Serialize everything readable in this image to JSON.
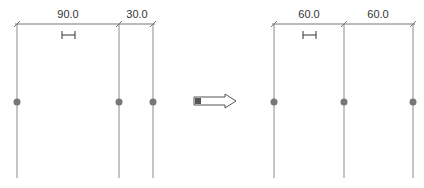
{
  "before": {
    "dimensions": [
      {
        "label": "90.0",
        "x1": 17,
        "x2": 119
      },
      {
        "label": "30.0",
        "x1": 119,
        "x2": 153
      }
    ],
    "gridlines_x": [
      17,
      119,
      153
    ]
  },
  "after": {
    "dimensions": [
      {
        "label": "60.0",
        "x1": 274,
        "x2": 344
      },
      {
        "label": "60.0",
        "x1": 344,
        "x2": 413
      }
    ],
    "gridlines_x": [
      274,
      344,
      413
    ]
  },
  "arrow": {
    "direction": "right"
  },
  "colors": {
    "line": "#8a8a8a",
    "dot": "#777777",
    "dimension": "#777777",
    "text": "#333333"
  }
}
